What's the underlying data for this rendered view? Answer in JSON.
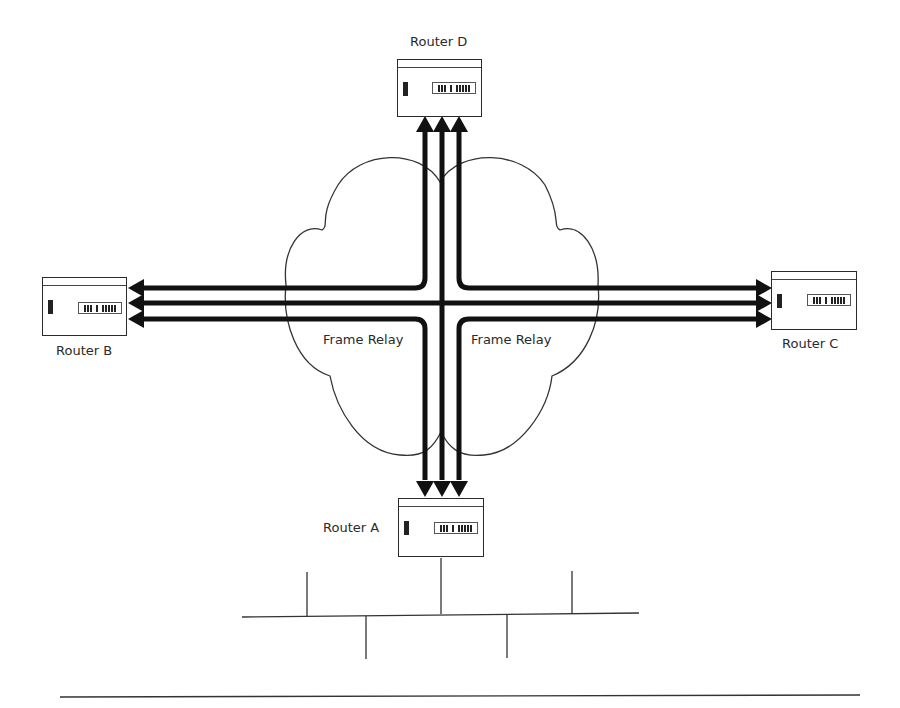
{
  "diagram": {
    "cloud": {
      "labels": [
        "Frame Relay",
        "Frame Relay"
      ]
    },
    "routers": [
      {
        "id": "A",
        "label": "Router A"
      },
      {
        "id": "B",
        "label": "Router B"
      },
      {
        "id": "C",
        "label": "Router C"
      },
      {
        "id": "D",
        "label": "Router D"
      }
    ],
    "links": [
      {
        "from": "A",
        "to": "D"
      },
      {
        "from": "A",
        "to": "B"
      },
      {
        "from": "A",
        "to": "C"
      },
      {
        "from": "B",
        "to": "C"
      },
      {
        "from": "B",
        "to": "D"
      },
      {
        "from": "C",
        "to": "D"
      }
    ],
    "lan": {
      "attached_to": "A",
      "drops_above": 2,
      "drops_below": 2
    },
    "colors": {
      "line": "#111111",
      "cloud_outline": "#333333",
      "background": "#ffffff"
    }
  }
}
